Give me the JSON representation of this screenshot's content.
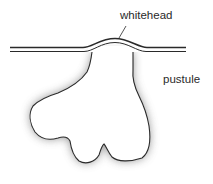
{
  "diagram": {
    "labels": {
      "whitehead": "whitehead",
      "pustule": "pustule"
    },
    "colors": {
      "line": "#2a2a2a",
      "shadow": "#7a7a7a",
      "fill": "#ffffff",
      "background": "#ffffff"
    }
  }
}
